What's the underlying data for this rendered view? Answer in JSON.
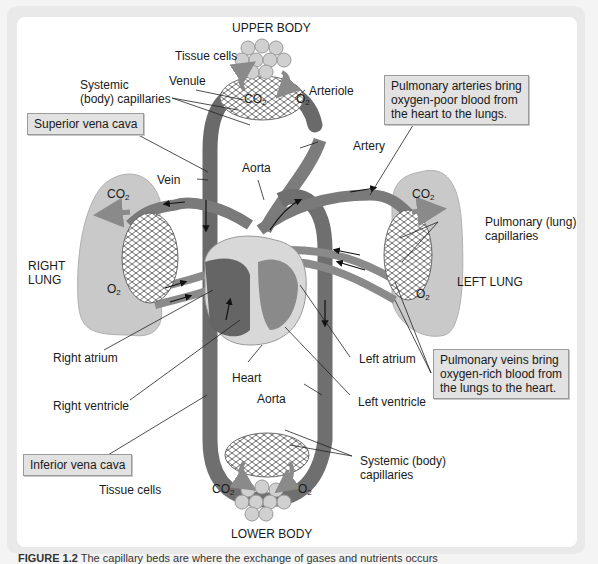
{
  "diagram": {
    "regions": {
      "upper_body": "UPPER BODY",
      "lower_body": "LOWER BODY",
      "right_lung": [
        "RIGHT",
        "LUNG"
      ],
      "left_lung": "LEFT LUNG"
    },
    "labels": {
      "tissue_cells_top": "Tissue cells",
      "tissue_cells_bottom": "Tissue cells",
      "systemic_capillaries_top": [
        "Systemic",
        "(body) capillaries"
      ],
      "venule": "Venule",
      "arteriole": "Arteriole",
      "artery": "Artery",
      "aorta_top": "Aorta",
      "vein": "Vein",
      "pulmonary_capillaries": [
        "Pulmonary (lung)",
        "capillaries"
      ],
      "right_atrium": "Right atrium",
      "right_ventricle": "Right ventricle",
      "heart": "Heart",
      "aorta_bottom": "Aorta",
      "left_atrium": "Left atrium",
      "left_ventricle": "Left ventricle",
      "systemic_capillaries_bottom": [
        "Systemic (body)",
        "capillaries"
      ]
    },
    "gases": {
      "co2": "CO",
      "o2": "O",
      "subscript": "2"
    },
    "callouts": {
      "superior_vena_cava": "Superior vena cava",
      "inferior_vena_cava": "Inferior vena cava",
      "pulmonary_arteries": [
        "Pulmonary arteries bring",
        "oxygen-poor blood from",
        "the heart to the lungs."
      ],
      "pulmonary_veins": [
        "Pulmonary veins bring",
        "oxygen-rich blood from",
        "the lungs to the heart."
      ]
    },
    "colors": {
      "vessel": "#7a7a7a",
      "vessel_dark": "#555555",
      "lung": "#c9c9c9",
      "heart_light": "#d8d8d8",
      "heart_dark": "#666666",
      "callout_bg": "#e2e2e2",
      "panel_border": "#e9e9e9"
    }
  },
  "caption": {
    "figure_label": "FIGURE 1.2",
    "text": "The capillary beds are where the exchange of gases and nutrients occurs"
  }
}
